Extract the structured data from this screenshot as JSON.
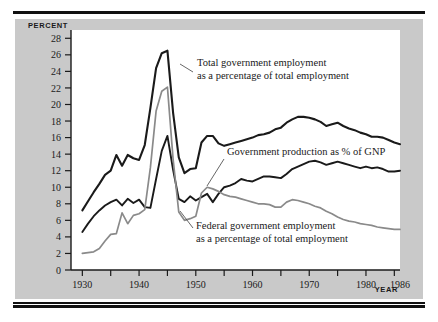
{
  "figure": {
    "background_color": "#ffffff",
    "panel_color": "#c9c9c9",
    "plot_color": "#ffffff",
    "rule_color": "#111111"
  },
  "axes": {
    "y_axis_title": "PERCENT",
    "x_axis_title": "YEAR",
    "y_ticks": [
      0,
      2,
      4,
      6,
      8,
      10,
      12,
      14,
      16,
      18,
      20,
      22,
      24,
      26,
      28
    ],
    "y_tick_labels": [
      "0",
      "2",
      "4",
      "6",
      "8",
      "10",
      "12",
      "14",
      "16",
      "18",
      "20",
      "22",
      "24",
      "26",
      "28"
    ],
    "x_ticks": [
      1930,
      1940,
      1950,
      1960,
      1970,
      1980,
      1986
    ],
    "x_tick_labels": [
      "1930",
      "1940",
      "1950",
      "1960",
      "1970",
      "1980",
      "1986"
    ],
    "x_minor_ticks": [
      1930,
      1935,
      1940,
      1945,
      1950,
      1955,
      1960,
      1965,
      1970,
      1975,
      1980,
      1985
    ],
    "xlim": [
      1928,
      1986
    ],
    "ylim": [
      0,
      29
    ]
  },
  "annotations": [
    {
      "name": "total-government-employment-label",
      "lines": [
        "Total government employment",
        "as a percentage of total employment"
      ],
      "x": 197,
      "y": 66,
      "leader": {
        "x1": 193,
        "y1": 72,
        "x2": 180,
        "y2": 64
      }
    },
    {
      "name": "government-production-label",
      "lines": [
        "Government production as % of GNP"
      ],
      "x": 227,
      "y": 155,
      "leader": {
        "x1": 224,
        "y1": 159,
        "x2": 207,
        "y2": 186
      }
    },
    {
      "name": "federal-government-employment-label",
      "lines": [
        "Federal government employment",
        "as a percentage of total employment"
      ],
      "x": 196,
      "y": 229,
      "leader": {
        "x1": 193,
        "y1": 228,
        "x2": 180,
        "y2": 211
      }
    }
  ],
  "chart_data": {
    "type": "line",
    "title": "",
    "xlabel": "YEAR",
    "ylabel": "PERCENT",
    "xlim": [
      1928,
      1986
    ],
    "ylim": [
      0,
      29
    ],
    "grid": false,
    "legend_position": "inline-annotations",
    "series": [
      {
        "name": "Total government employment as a percentage of total employment",
        "color": "#1a1a1a",
        "width": 2.1,
        "x": [
          1930,
          1931,
          1932,
          1933,
          1934,
          1935,
          1936,
          1937,
          1938,
          1939,
          1940,
          1941,
          1942,
          1943,
          1944,
          1945,
          1946,
          1947,
          1948,
          1949,
          1950,
          1951,
          1952,
          1953,
          1954,
          1955,
          1956,
          1957,
          1958,
          1959,
          1960,
          1961,
          1962,
          1963,
          1964,
          1965,
          1966,
          1967,
          1968,
          1969,
          1970,
          1971,
          1972,
          1973,
          1974,
          1975,
          1976,
          1977,
          1978,
          1979,
          1980,
          1981,
          1982,
          1983,
          1984,
          1985,
          1986
        ],
        "values": [
          7.2,
          8.3,
          9.4,
          10.4,
          11.5,
          12.0,
          13.9,
          12.6,
          13.9,
          13.5,
          13.3,
          15.1,
          19.6,
          24.4,
          26.2,
          26.5,
          19.0,
          13.6,
          11.7,
          12.2,
          12.3,
          15.4,
          16.2,
          16.2,
          15.3,
          15.0,
          15.2,
          15.4,
          15.6,
          15.8,
          16.0,
          16.3,
          16.4,
          16.6,
          17.0,
          17.2,
          17.8,
          18.2,
          18.5,
          18.5,
          18.4,
          18.2,
          17.9,
          17.4,
          17.6,
          17.8,
          17.4,
          17.1,
          16.9,
          16.6,
          16.4,
          16.1,
          16.1,
          16.0,
          15.7,
          15.4,
          15.2
        ]
      },
      {
        "name": "Government production as % of GNP",
        "color": "#1a1a1a",
        "width": 1.9,
        "x": [
          1930,
          1931,
          1932,
          1933,
          1934,
          1935,
          1936,
          1937,
          1938,
          1939,
          1940,
          1941,
          1942,
          1943,
          1944,
          1945,
          1946,
          1947,
          1948,
          1949,
          1950,
          1951,
          1952,
          1953,
          1954,
          1955,
          1956,
          1957,
          1958,
          1959,
          1960,
          1961,
          1962,
          1963,
          1964,
          1965,
          1966,
          1967,
          1968,
          1969,
          1970,
          1971,
          1972,
          1973,
          1974,
          1975,
          1976,
          1977,
          1978,
          1979,
          1980,
          1981,
          1982,
          1983,
          1984,
          1985,
          1986
        ],
        "values": [
          4.6,
          5.6,
          6.5,
          7.2,
          7.8,
          8.2,
          8.5,
          7.8,
          8.6,
          8.1,
          8.5,
          7.6,
          7.5,
          11.0,
          14.4,
          16.2,
          12.1,
          8.6,
          8.2,
          8.9,
          8.4,
          8.8,
          9.2,
          8.2,
          9.2,
          10.0,
          10.2,
          10.5,
          11.0,
          10.8,
          10.7,
          11.0,
          11.3,
          11.3,
          11.2,
          11.1,
          11.6,
          12.2,
          12.5,
          12.8,
          13.1,
          13.2,
          13.0,
          12.7,
          12.9,
          13.1,
          12.9,
          12.7,
          12.5,
          12.3,
          12.5,
          12.3,
          12.4,
          12.2,
          11.9,
          11.9,
          12.0
        ]
      },
      {
        "name": "Federal government employment as a percentage of total employment",
        "color": "#8a8a8a",
        "width": 1.7,
        "x": [
          1930,
          1931,
          1932,
          1933,
          1934,
          1935,
          1936,
          1937,
          1938,
          1939,
          1940,
          1941,
          1942,
          1943,
          1944,
          1945,
          1946,
          1947,
          1948,
          1949,
          1950,
          1951,
          1952,
          1953,
          1954,
          1955,
          1956,
          1957,
          1958,
          1959,
          1960,
          1961,
          1962,
          1963,
          1964,
          1965,
          1966,
          1967,
          1968,
          1969,
          1970,
          1971,
          1972,
          1973,
          1974,
          1975,
          1976,
          1977,
          1978,
          1979,
          1980,
          1981,
          1982,
          1983,
          1984,
          1985,
          1986
        ],
        "values": [
          2.0,
          2.1,
          2.2,
          2.6,
          3.5,
          4.3,
          4.4,
          6.9,
          5.6,
          6.6,
          6.8,
          7.3,
          12.4,
          19.2,
          21.6,
          22.1,
          13.4,
          7.0,
          6.0,
          6.2,
          6.5,
          9.3,
          10.0,
          9.8,
          9.5,
          9.1,
          8.9,
          8.8,
          8.6,
          8.4,
          8.2,
          8.0,
          8.0,
          7.9,
          7.6,
          7.6,
          8.2,
          8.5,
          8.4,
          8.2,
          8.0,
          7.7,
          7.5,
          7.1,
          6.8,
          6.4,
          6.1,
          5.9,
          5.8,
          5.6,
          5.5,
          5.4,
          5.2,
          5.1,
          5.0,
          4.9,
          4.9
        ]
      }
    ]
  }
}
